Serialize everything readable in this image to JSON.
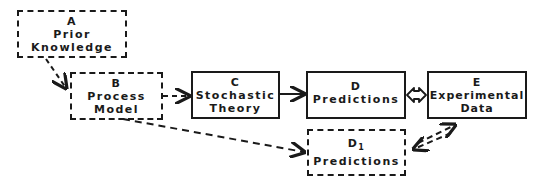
{
  "diagram": {
    "nodes": [
      {
        "id": "A",
        "lines": [
          "Prior",
          "Knowledge"
        ],
        "style": "dashed"
      },
      {
        "id": "B",
        "lines": [
          "Process",
          "Model"
        ],
        "style": "dashed"
      },
      {
        "id": "C",
        "lines": [
          "Stochastic",
          "Theory"
        ],
        "style": "solid"
      },
      {
        "id": "D",
        "lines": [
          "Predictions"
        ],
        "style": "solid"
      },
      {
        "id": "E",
        "lines": [
          "Experimental",
          "Data"
        ],
        "style": "solid"
      },
      {
        "id": "D",
        "sub": "1",
        "lines": [
          "Predictions"
        ],
        "style": "dashed"
      }
    ],
    "edges": [
      {
        "from": "A",
        "to": "B",
        "style": "dashed",
        "direction": "forward"
      },
      {
        "from": "B",
        "to": "C",
        "style": "dashed",
        "direction": "forward"
      },
      {
        "from": "C",
        "to": "D",
        "style": "solid",
        "direction": "forward"
      },
      {
        "from": "D",
        "to": "E",
        "style": "solid-double",
        "direction": "both"
      },
      {
        "from": "B",
        "to": "D1",
        "style": "dashed",
        "direction": "forward"
      },
      {
        "from": "D1",
        "to": "E",
        "style": "dashed",
        "direction": "both"
      }
    ],
    "colors": {
      "ink": "#1a1a1a",
      "background": "#ffffff"
    }
  }
}
